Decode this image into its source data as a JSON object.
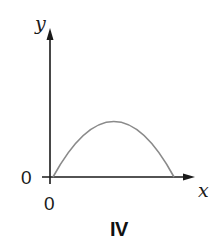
{
  "figure": {
    "panel_label": "IV",
    "axes": {
      "x_label": "x",
      "y_label": "y",
      "x_origin_label": "0",
      "y_origin_label": "0"
    },
    "curve": {
      "shape": "downward-opening parabola (inverted arch)",
      "starts_at": "origin",
      "returns_to": "x-axis",
      "color": "#8a8a8a"
    },
    "colors": {
      "axes": "#1a1a1a",
      "curve": "#8a8a8a",
      "background": "#ffffff"
    }
  }
}
